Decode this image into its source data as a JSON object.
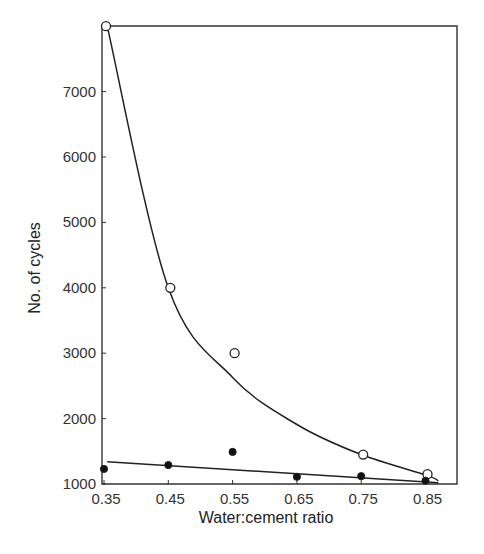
{
  "chart_data": {
    "type": "scatter",
    "title": "",
    "xlabel": "Water:cement ratio",
    "ylabel": "No. of cycles",
    "x_ticks": [
      "0.35",
      "0.45",
      "0.55",
      "0.65",
      "0.75",
      "0.85"
    ],
    "y_ticks": [
      "1000",
      "2000",
      "3000",
      "4000",
      "5000",
      "6000",
      "7000"
    ],
    "xlim": [
      0.35,
      0.9
    ],
    "ylim": [
      1000,
      8000
    ],
    "grid": false,
    "legend": null,
    "series": [
      {
        "name": "open-circles",
        "marker": "open-circle",
        "fit": "curve",
        "x": [
          0.35,
          0.45,
          0.55,
          0.75,
          0.85
        ],
        "y": [
          8000,
          4000,
          3000,
          1450,
          1150
        ]
      },
      {
        "name": "filled-circles",
        "marker": "filled-circle",
        "fit": "straight-line",
        "x": [
          0.35,
          0.45,
          0.55,
          0.65,
          0.75,
          0.85
        ],
        "y": [
          1230,
          1290,
          1490,
          1110,
          1120,
          1050
        ]
      }
    ],
    "fit_lines": {
      "curve": {
        "x": [
          0.355,
          0.45,
          0.55,
          0.65,
          0.75,
          0.85,
          0.87
        ],
        "y": [
          8000,
          4000,
          2630,
          1910,
          1450,
          1140,
          1050
        ]
      },
      "straight": {
        "x": [
          0.355,
          0.87
        ],
        "y": [
          1340,
          1020
        ]
      }
    }
  }
}
